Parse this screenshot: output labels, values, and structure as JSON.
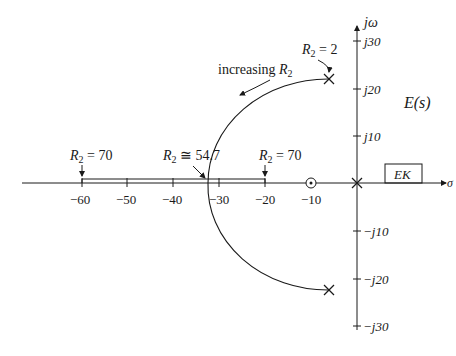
{
  "diagram": {
    "type": "root-locus",
    "axes": {
      "real_axis_label": "σ",
      "imag_axis_label": "jω",
      "real_ticks": [
        "−60",
        "−50",
        "−40",
        "−30",
        "−20",
        "−10"
      ],
      "imag_ticks_pos": [
        "j30",
        "j20",
        "j10"
      ],
      "imag_ticks_neg": [
        "−j10",
        "−j20",
        "−j30"
      ]
    },
    "poles": [
      {
        "label": "upper-pole",
        "re": -6,
        "im": 22.5
      },
      {
        "label": "lower-pole",
        "re": -6,
        "im": -22.5
      },
      {
        "label": "origin-pole",
        "re": 0,
        "im": 0
      }
    ],
    "zeros": [
      {
        "label": "zero",
        "re": -10,
        "im": 0
      }
    ],
    "annotations": {
      "r2_start": {
        "sym": "R",
        "sub": "2",
        "rest": " = 2"
      },
      "increasing": {
        "text": "increasing ",
        "sym": "R",
        "sub": "2"
      },
      "breakin": {
        "sym": "R",
        "sub": "2",
        "rest": " ≅ 54.7"
      },
      "r2_left": {
        "sym": "R",
        "sub": "2",
        "rest": " = 70"
      },
      "r2_right": {
        "sym": "R",
        "sub": "2",
        "rest": " = 70"
      },
      "transfer": "E(s)",
      "box": "EK"
    }
  }
}
